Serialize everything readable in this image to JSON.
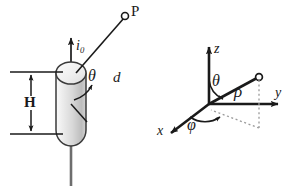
{
  "figure": {
    "background_color": "#ffffff",
    "line_color": "#1a1a1a",
    "cylinder_fill_light": "#f2f2f2",
    "cylinder_fill_dark": "#b9b9b9",
    "dotted_color": "#9a9a9a",
    "width": 291,
    "height": 195
  },
  "left_diagram": {
    "name": "wire-segment-diagram",
    "labels": {
      "point_p": "P",
      "current": "i",
      "current_subscript": "0",
      "angle_theta": "θ",
      "distance_d": "d",
      "height_h": "H"
    },
    "elements": {
      "field_point_marker": "open-circle",
      "current_direction": "upward-arrow",
      "cylinder_orientation": "vertical",
      "dimension_arrows": "double-headed-vertical"
    }
  },
  "right_diagram": {
    "name": "spherical-coordinates-diagram",
    "labels": {
      "axis_z": "z",
      "axis_y": "y",
      "axis_x": "x",
      "radial_rho": "ρ",
      "polar_theta": "θ",
      "azimuth_phi": "φ"
    },
    "elements": {
      "endpoint_marker": "open-circle",
      "projection_lines": "dotted",
      "axis_arrows": "solid-arrowheads"
    }
  }
}
